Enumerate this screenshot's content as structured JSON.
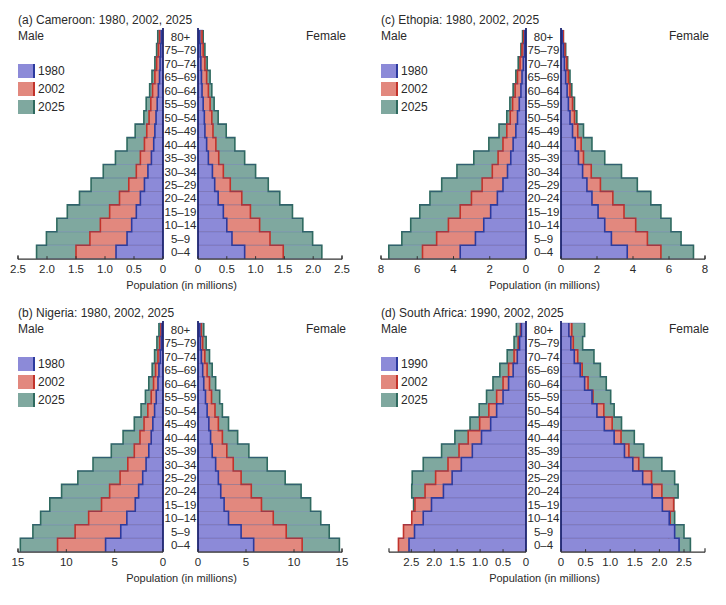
{
  "colors": {
    "series_fill": [
      "#8c8ad8",
      "#e2887e",
      "#7fa89f"
    ],
    "series_stroke": [
      "#2c3a9e",
      "#c2332b",
      "#2f6a5f"
    ],
    "text": "#2a2a2a",
    "axis": "#333333"
  },
  "common": {
    "male_label": "Male",
    "female_label": "Female",
    "axis_title": "Population (in millions)",
    "age_groups": [
      "80+",
      "75–79",
      "70–74",
      "65–69",
      "60–64",
      "55–59",
      "50–54",
      "45–49",
      "40–44",
      "35–39",
      "30–34",
      "25–29",
      "20–24",
      "15–19",
      "10–14",
      "5–9",
      "0–4"
    ]
  },
  "chart_data": [
    {
      "id": "a",
      "type": "population-pyramid (horizontal bar)",
      "title": "(a)  Cameroon: 1980, 2002, 2025",
      "xlabel": "Population (in millions)",
      "xlim": [
        0,
        2.5
      ],
      "ticks": [
        0,
        0.5,
        1.0,
        1.5,
        2.0,
        2.5
      ],
      "tick_labels": [
        "0",
        "0.5",
        "1.0",
        "1.5",
        "2.0",
        "2.5"
      ],
      "legend": [
        "1980",
        "2002",
        "2025"
      ],
      "categories_order": "80+ to 0-4 (top to bottom)",
      "series": [
        {
          "name": "1980",
          "male": [
            0.03,
            0.04,
            0.05,
            0.06,
            0.08,
            0.1,
            0.12,
            0.14,
            0.16,
            0.2,
            0.26,
            0.32,
            0.39,
            0.46,
            0.54,
            0.62,
            0.81
          ],
          "female": [
            0.03,
            0.04,
            0.05,
            0.06,
            0.07,
            0.09,
            0.11,
            0.12,
            0.15,
            0.18,
            0.25,
            0.29,
            0.35,
            0.44,
            0.5,
            0.59,
            0.81
          ]
        },
        {
          "name": "2002",
          "male": [
            0.06,
            0.08,
            0.11,
            0.14,
            0.18,
            0.21,
            0.24,
            0.28,
            0.32,
            0.39,
            0.46,
            0.59,
            0.75,
            0.92,
            1.08,
            1.26,
            1.5
          ],
          "female": [
            0.07,
            0.09,
            0.12,
            0.15,
            0.18,
            0.21,
            0.24,
            0.26,
            0.31,
            0.36,
            0.44,
            0.56,
            0.76,
            0.91,
            1.07,
            1.25,
            1.48
          ]
        },
        {
          "name": "2025",
          "male": [
            0.09,
            0.11,
            0.14,
            0.19,
            0.23,
            0.29,
            0.33,
            0.48,
            0.62,
            0.82,
            1.03,
            1.24,
            1.44,
            1.65,
            1.83,
            2.01,
            2.18
          ],
          "female": [
            0.09,
            0.12,
            0.16,
            0.21,
            0.24,
            0.28,
            0.35,
            0.49,
            0.64,
            0.81,
            1.0,
            1.22,
            1.42,
            1.64,
            1.82,
            1.99,
            2.15
          ]
        }
      ]
    },
    {
      "id": "b",
      "type": "population-pyramid (horizontal bar)",
      "title": "(b)  Nigeria: 1980, 2002, 2025",
      "xlabel": "Population (in millions)",
      "xlim": [
        0,
        15
      ],
      "ticks": [
        0,
        5,
        10,
        15
      ],
      "tick_labels": [
        "0",
        "5",
        "10",
        "15"
      ],
      "legend": [
        "1980",
        "2002",
        "2025"
      ],
      "categories_order": "80+ to 0-4 (top to bottom)",
      "series": [
        {
          "name": "1980",
          "male": [
            0.1,
            0.17,
            0.28,
            0.42,
            0.52,
            0.7,
            0.87,
            1.05,
            1.22,
            1.47,
            1.75,
            2.1,
            2.52,
            2.87,
            3.74,
            4.37,
            5.94
          ],
          "female": [
            0.18,
            0.25,
            0.35,
            0.49,
            0.6,
            0.78,
            0.95,
            1.13,
            1.31,
            1.48,
            1.84,
            2.12,
            2.37,
            2.72,
            3.18,
            4.49,
            5.8
          ]
        },
        {
          "name": "2002",
          "male": [
            0.21,
            0.35,
            0.52,
            0.77,
            0.98,
            1.22,
            1.57,
            1.96,
            2.38,
            2.97,
            3.64,
            4.44,
            5.52,
            6.36,
            7.69,
            9.09,
            10.91
          ],
          "female": [
            0.35,
            0.49,
            0.71,
            0.95,
            1.2,
            1.41,
            1.77,
            2.12,
            2.54,
            3.0,
            3.67,
            4.49,
            5.55,
            6.61,
            7.84,
            9.19,
            10.85
          ]
        },
        {
          "name": "2025",
          "male": [
            0.42,
            0.63,
            0.87,
            1.12,
            1.47,
            1.82,
            2.27,
            2.97,
            4.13,
            5.35,
            7.24,
            8.81,
            10.49,
            11.71,
            12.66,
            13.46,
            14.76
          ],
          "female": [
            0.6,
            0.85,
            1.2,
            1.48,
            1.84,
            2.26,
            2.54,
            3.18,
            4.13,
            5.3,
            7.21,
            9.08,
            10.74,
            11.73,
            12.79,
            13.67,
            14.73
          ]
        }
      ]
    },
    {
      "id": "c",
      "type": "population-pyramid (horizontal bar)",
      "title": "(c)  Ethopia: 1980, 2002, 2025",
      "xlabel": "Population (in millions)",
      "xlim": [
        0,
        8
      ],
      "ticks": [
        0,
        2,
        4,
        6,
        8
      ],
      "tick_labels": [
        "0",
        "2",
        "4",
        "6",
        "8"
      ],
      "legend": [
        "1980",
        "2002",
        "2025"
      ],
      "categories_order": "80+ to 0-4 (top to bottom)",
      "series": [
        {
          "name": "1980",
          "male": [
            0.06,
            0.09,
            0.15,
            0.22,
            0.28,
            0.37,
            0.47,
            0.56,
            0.71,
            0.84,
            1.02,
            1.27,
            1.58,
            1.95,
            2.33,
            2.79,
            3.63
          ],
          "female": [
            0.07,
            0.13,
            0.19,
            0.26,
            0.34,
            0.41,
            0.5,
            0.64,
            0.79,
            0.97,
            1.2,
            1.44,
            1.72,
            2.06,
            2.43,
            2.8,
            3.68
          ]
        },
        {
          "name": "2002",
          "male": [
            0.13,
            0.22,
            0.33,
            0.47,
            0.6,
            0.74,
            0.87,
            1.06,
            1.27,
            1.54,
            1.86,
            2.42,
            3.01,
            3.63,
            4.28,
            4.93,
            5.71
          ],
          "female": [
            0.13,
            0.22,
            0.32,
            0.41,
            0.5,
            0.64,
            0.75,
            0.93,
            1.12,
            1.25,
            1.68,
            2.19,
            2.88,
            3.5,
            4.15,
            4.8,
            5.55
          ]
        },
        {
          "name": "2025",
          "male": [
            0.19,
            0.28,
            0.43,
            0.56,
            0.71,
            0.89,
            1.06,
            1.49,
            2.05,
            2.88,
            3.81,
            4.65,
            5.3,
            5.86,
            6.36,
            6.85,
            7.57
          ],
          "female": [
            0.13,
            0.26,
            0.37,
            0.5,
            0.6,
            0.75,
            0.88,
            1.25,
            1.72,
            2.43,
            3.36,
            4.24,
            4.99,
            5.55,
            6.11,
            6.67,
            7.36
          ]
        }
      ]
    },
    {
      "id": "d",
      "type": "population-pyramid (horizontal bar)",
      "title": "(d)  South Africa: 1990, 2002, 2025",
      "xlabel": "Population (in millions)",
      "xlim": [
        0,
        2.95
      ],
      "ticks": [
        0,
        0.5,
        1.0,
        1.5,
        2.0,
        2.5
      ],
      "tick_labels": [
        "0",
        "0.5",
        "1.0",
        "1.5",
        "2.0",
        "2.5"
      ],
      "legend": [
        "1990",
        "2002",
        "2025"
      ],
      "categories_order": "80+ to 0-4 (top to bottom)",
      "series": [
        {
          "name": "1990",
          "male": [
            0.1,
            0.14,
            0.19,
            0.28,
            0.38,
            0.5,
            0.64,
            0.77,
            0.97,
            1.17,
            1.41,
            1.61,
            1.8,
            2.06,
            2.24,
            2.43,
            2.55
          ],
          "female": [
            0.16,
            0.2,
            0.27,
            0.39,
            0.48,
            0.63,
            0.73,
            0.88,
            1.08,
            1.29,
            1.46,
            1.66,
            1.85,
            2.06,
            2.2,
            2.31,
            2.4
          ]
        },
        {
          "name": "2002",
          "male": [
            0.12,
            0.17,
            0.26,
            0.38,
            0.5,
            0.64,
            0.81,
            1.01,
            1.26,
            1.46,
            1.7,
            1.97,
            2.2,
            2.42,
            2.49,
            2.67,
            2.78
          ],
          "female": [
            0.22,
            0.25,
            0.34,
            0.43,
            0.55,
            0.65,
            0.87,
            1.04,
            1.22,
            1.38,
            1.58,
            1.84,
            2.05,
            2.29,
            2.22,
            2.19,
            2.19
          ]
        },
        {
          "name": "2025",
          "male": [
            0.21,
            0.26,
            0.41,
            0.57,
            0.72,
            0.86,
            1.02,
            1.22,
            1.55,
            1.84,
            2.24,
            2.48,
            2.49,
            2.45,
            2.32,
            2.32,
            2.31
          ],
          "female": [
            0.48,
            0.44,
            0.67,
            0.8,
            0.92,
            1.01,
            1.08,
            1.23,
            1.49,
            1.68,
            2.05,
            2.31,
            2.38,
            2.29,
            2.31,
            2.5,
            2.63
          ]
        }
      ]
    }
  ]
}
